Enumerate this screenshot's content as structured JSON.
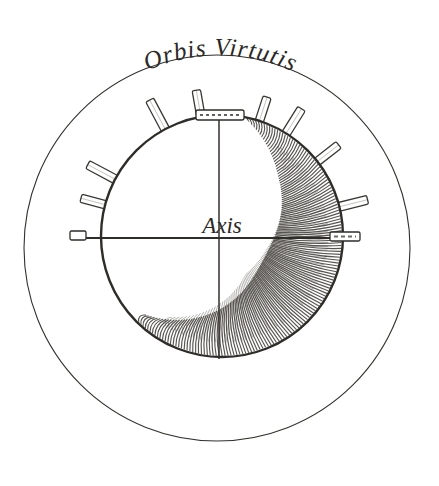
{
  "plate": {
    "kind": "engraving-diagram",
    "background_color": "#ffffff",
    "ink_color": "#33312d",
    "shading_color": "#4a4742",
    "title": "Orbis Virtutis",
    "axis_label": "Axis",
    "width": 439,
    "height": 486
  },
  "outer_circle": {
    "name": "outer-boundary-circle",
    "cx": 217,
    "cy": 248,
    "r": 193,
    "stroke_width": 1.1
  },
  "sphere": {
    "name": "central-sphere",
    "cx": 222,
    "cy": 236,
    "r": 122,
    "stroke_width": 2.4,
    "shading": "crescent-hatching-right-and-bottom"
  },
  "axes": {
    "horizontal": {
      "name": "horizontal-axis-line",
      "x1": 72,
      "y1": 238,
      "x2": 360,
      "y2": 238
    },
    "vertical": {
      "name": "vertical-axis-line",
      "x1": 219,
      "y1": 116,
      "x2": 219,
      "y2": 360
    },
    "caps": [
      {
        "name": "axis-cap-left",
        "x": 76,
        "y": 238,
        "angle": 90
      },
      {
        "name": "axis-cap-right",
        "x": 352,
        "y": 238,
        "angle": 90
      },
      {
        "name": "axis-cap-top",
        "x": 219,
        "y": 115,
        "angle": 0
      }
    ]
  },
  "spikes": [
    {
      "name": "spike-nw-upper",
      "angle": -118,
      "len": 40
    },
    {
      "name": "spike-nnw",
      "angle": -100,
      "len": 34
    },
    {
      "name": "spike-n-left",
      "angle": -72,
      "len": 32
    },
    {
      "name": "spike-n-right",
      "angle": -58,
      "len": 36
    },
    {
      "name": "spike-ne",
      "angle": -38,
      "len": 34
    },
    {
      "name": "spike-e-upper",
      "angle": -14,
      "len": 36
    },
    {
      "name": "spike-w-mid",
      "angle": -152,
      "len": 38
    },
    {
      "name": "spike-w-upper",
      "angle": -165,
      "len": 30
    }
  ],
  "hatching": {
    "name": "sphere-shading-hatching",
    "stroke_count": 150,
    "opacity": 0.85
  }
}
